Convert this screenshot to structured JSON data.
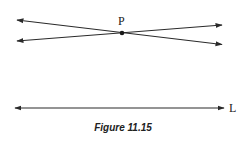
{
  "figure": {
    "caption": "Figure 11.15",
    "point_label": "P",
    "line_label": "L",
    "colors": {
      "line": "#2a2a2a",
      "background": "#ffffff"
    }
  }
}
